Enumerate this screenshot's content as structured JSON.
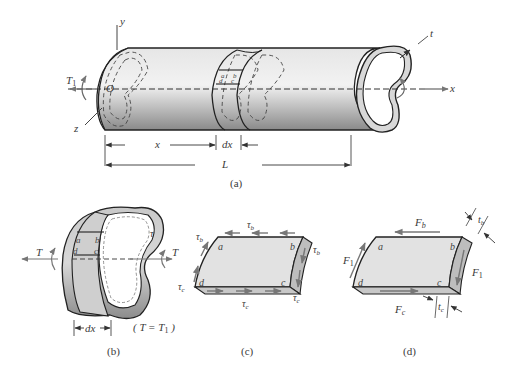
{
  "figure": {
    "panels": [
      {
        "id": "a",
        "caption": "(a)",
        "description": "Thin-walled tube of arbitrary cross section subjected to torque",
        "labels": {
          "y_axis": "y",
          "z_axis": "z",
          "x_axis": "x",
          "origin": "O",
          "torque": "T",
          "torque_sub": "1",
          "thickness": "t",
          "dim_x": "x",
          "dim_dx": "dx",
          "dim_L": "L",
          "pt_a": "a",
          "pt_b": "b",
          "pt_c": "c",
          "pt_d": "d"
        }
      },
      {
        "id": "b",
        "caption": "(b)",
        "description": "Slice of tube of length dx",
        "labels": {
          "torque_left": "T",
          "torque_right": "T",
          "tau": "τ",
          "dim_dx": "dx",
          "equation": "( T = T",
          "equation_sub": "1",
          "equation_end": " )",
          "pt_a": "a",
          "pt_b": "b",
          "pt_c": "c",
          "pt_d": "d"
        }
      },
      {
        "id": "c",
        "caption": "(c)",
        "description": "Element abcd with shear stresses",
        "labels": {
          "tau": "τ",
          "sub_b": "b",
          "sub_c": "c",
          "pt_a": "a",
          "pt_b": "b",
          "pt_c": "c",
          "pt_d": "d"
        }
      },
      {
        "id": "d",
        "caption": "(d)",
        "description": "Element abcd with shear forces",
        "labels": {
          "force": "F",
          "sub_b": "b",
          "sub_c": "c",
          "sub_1": "1",
          "thickness": "t",
          "pt_a": "a",
          "pt_b": "b",
          "pt_c": "c",
          "pt_d": "d"
        }
      }
    ]
  }
}
